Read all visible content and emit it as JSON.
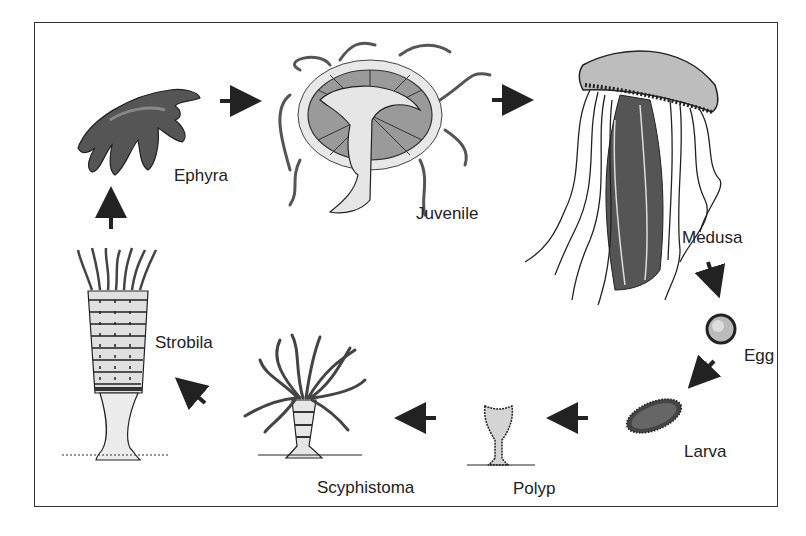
{
  "diagram": {
    "type": "life-cycle",
    "stages": [
      {
        "id": "medusa",
        "label": "Medusa"
      },
      {
        "id": "egg",
        "label": "Egg"
      },
      {
        "id": "larva",
        "label": "Larva"
      },
      {
        "id": "polyp",
        "label": "Polyp"
      },
      {
        "id": "scyphistoma",
        "label": "Scyphistoma"
      },
      {
        "id": "strobila",
        "label": "Strobila"
      },
      {
        "id": "ephyra",
        "label": "Ephyra"
      },
      {
        "id": "juvenile",
        "label": "Juvenile"
      }
    ],
    "flow": [
      "Medusa",
      "Egg",
      "Larva",
      "Polyp",
      "Scyphistoma",
      "Strobila",
      "Ephyra",
      "Juvenile",
      "Medusa"
    ],
    "colors": {
      "line": "#222222",
      "fill_light": "#e6e6e6",
      "fill_mid": "#9a9a9a",
      "fill_dark": "#3a3a3a",
      "border": "#333333"
    }
  }
}
